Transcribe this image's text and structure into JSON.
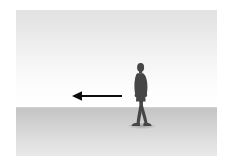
{
  "scene": {
    "title": "Walking person silhouette with leftward motion arrow",
    "description": "A dark silhouette of a person walking, shown in profile on a gray gradient ground plane beneath a pale gradient sky, with a black arrow pointing to the left indicating direction of motion.",
    "canvas": {
      "width": 228,
      "height": 166
    },
    "frame": {
      "left": 16,
      "top": 10,
      "width": 201,
      "height": 146
    }
  },
  "colors": {
    "page_background": "#ffffff",
    "sky_top": "#e2e2e2",
    "sky_bottom": "#ffffff",
    "ground_top": "#c5c5c5",
    "ground_bottom": "#e9e9e9",
    "horizon_line": "#c9c9c9",
    "figure": "#4a4a4a",
    "figure_dark": "#3c3c3c",
    "arrow": "#0d0d0d",
    "shadow": "#5a5a5a"
  },
  "elements": {
    "sky": {
      "label": "sky",
      "y_top": 0,
      "y_bottom": 98
    },
    "ground": {
      "label": "ground plane",
      "y_top": 98,
      "y_bottom": 146
    },
    "horizon": {
      "label": "horizon line",
      "y": 97
    },
    "arrow": {
      "label": "motion arrow",
      "direction": "left",
      "tip_x": 56,
      "tail_x": 106,
      "y": 86,
      "shaft_thickness": 2,
      "head_length": 9,
      "head_width": 9
    },
    "figure": {
      "label": "walking person silhouette",
      "pose": "mid-stride walking",
      "facing": "left",
      "x": 113,
      "y": 52,
      "width": 24,
      "height": 68
    },
    "shadow": {
      "label": "ground shadow",
      "x": 112,
      "y": 113,
      "width": 28,
      "height": 6
    }
  }
}
